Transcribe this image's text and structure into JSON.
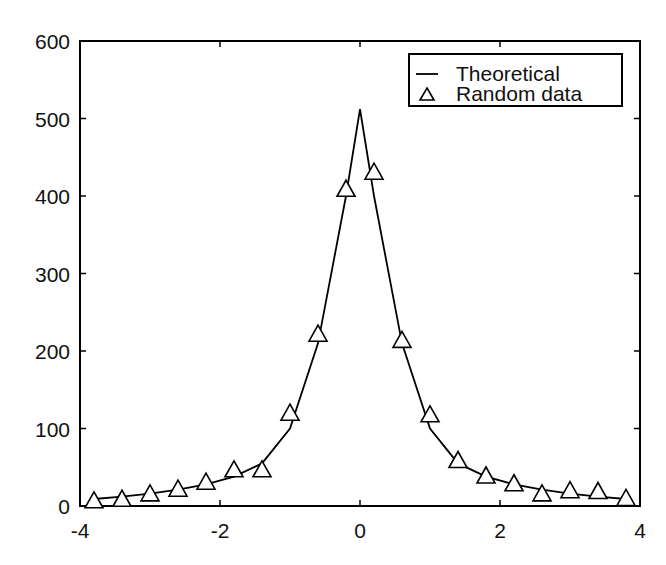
{
  "chart_data": {
    "type": "line",
    "title": "",
    "xlabel": "",
    "ylabel": "",
    "xlim": [
      -4,
      4
    ],
    "ylim": [
      0,
      600
    ],
    "grid": false,
    "legend_position": "upper right",
    "x_ticks": [
      -4,
      -2,
      0,
      2,
      4
    ],
    "x_tick_labels": [
      "-4",
      "-2",
      "0",
      "2",
      "4"
    ],
    "y_ticks": [
      0,
      100,
      200,
      300,
      400,
      500,
      600
    ],
    "y_tick_labels": [
      "0",
      "100",
      "200",
      "300",
      "400",
      "500",
      "600"
    ],
    "legend": [
      "Theoretical",
      "Random data"
    ],
    "series": [
      {
        "name": "Theoretical",
        "style": "line",
        "color": "#000000",
        "x": [
          -3.8,
          -3.4,
          -3.0,
          -2.6,
          -2.2,
          -1.8,
          -1.4,
          -1.0,
          -0.6,
          -0.2,
          0.0,
          0.2,
          0.6,
          1.0,
          1.4,
          1.8,
          2.2,
          2.6,
          3.0,
          3.4,
          3.8
        ],
        "values": [
          9,
          12,
          16,
          21,
          28,
          38,
          55,
          100,
          210,
          400,
          512,
          400,
          210,
          100,
          55,
          38,
          28,
          21,
          16,
          12,
          9
        ]
      },
      {
        "name": "Random data",
        "style": "triangle-markers",
        "color": "#000000",
        "x": [
          -3.8,
          -3.4,
          -3.0,
          -2.6,
          -2.2,
          -1.8,
          -1.4,
          -1.0,
          -0.6,
          -0.2,
          0.2,
          0.6,
          1.0,
          1.4,
          1.8,
          2.2,
          2.6,
          3.0,
          3.4,
          3.8
        ],
        "values": [
          8,
          10,
          17,
          23,
          32,
          48,
          48,
          121,
          223,
          410,
          432,
          215,
          119,
          60,
          40,
          30,
          17,
          21,
          20,
          11
        ]
      }
    ]
  }
}
